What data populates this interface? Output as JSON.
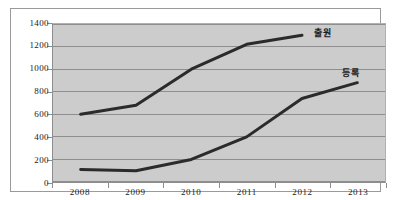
{
  "chart_data": {
    "type": "line",
    "title": "",
    "subtitle": "",
    "xlabel": "",
    "ylabel": "",
    "categories": [
      "2008",
      "2009",
      "2010",
      "2011",
      "2012",
      "2013"
    ],
    "ylim": [
      0,
      1400
    ],
    "ytick_values": [
      0,
      200,
      400,
      600,
      800,
      1000,
      1200,
      1400
    ],
    "ytick_labels": [
      "0",
      "200",
      "400",
      "600",
      "800",
      "1000",
      "1200",
      "1400"
    ],
    "grid": true,
    "grid_axis": "y",
    "legend_position": "inline-end-of-line",
    "series": [
      {
        "name": "출원",
        "label": "출원",
        "color": "#2b2b2b",
        "x": [
          "2008",
          "2009",
          "2010",
          "2011",
          "2012"
        ],
        "values": [
          600,
          680,
          1000,
          1220,
          1300
        ]
      },
      {
        "name": "등록",
        "label": "등록",
        "color": "#2b2b2b",
        "x": [
          "2008",
          "2009",
          "2010",
          "2011",
          "2012",
          "2013"
        ],
        "values": [
          110,
          100,
          200,
          400,
          740,
          880
        ]
      }
    ],
    "plot_background": "#cccccc",
    "figure_background": "#ffffff",
    "gridline_color": "#8d8d8d",
    "axis_color": "#8d8d8d",
    "line_color": "#2b2b2b",
    "line_width": 3
  },
  "labels": {
    "series_one": "출원",
    "series_two": "등록"
  },
  "yticks": {
    "t0": "0",
    "t1": "200",
    "t2": "400",
    "t3": "600",
    "t4": "800",
    "t5": "1000",
    "t6": "1200",
    "t7": "1400"
  },
  "xticks": {
    "x0": "2008",
    "x1": "2009",
    "x2": "2010",
    "x3": "2011",
    "x4": "2012",
    "x5": "2013"
  }
}
